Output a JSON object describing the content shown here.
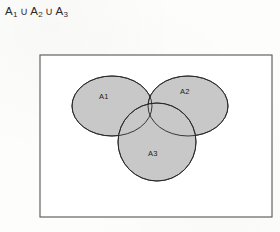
{
  "figure": {
    "title": {
      "set_a": "A",
      "sub_1": "1",
      "union_op_1": "∪",
      "set_b": "A",
      "sub_2": "2",
      "union_op_2": "∪",
      "set_c": "A",
      "sub_3": "3"
    },
    "universal_box": {
      "x": 40,
      "y": 55,
      "width": 232,
      "height": 162,
      "border_color": "#555555",
      "fill_color": "#ffffff"
    },
    "colors": {
      "set_fill": "#c8c8c8",
      "set_outline": "#262626",
      "background": "#fdfdfb",
      "text": "#202020"
    },
    "sets": [
      {
        "id": "a1",
        "label": "A1",
        "shape": "ellipse",
        "cx": 112,
        "cy": 106,
        "rx": 40,
        "ry": 30,
        "label_x": 99,
        "label_y": 99
      },
      {
        "id": "a2",
        "label": "A2",
        "shape": "ellipse",
        "cx": 188,
        "cy": 106,
        "rx": 40,
        "ry": 30,
        "label_x": 180,
        "label_y": 94
      },
      {
        "id": "a3",
        "label": "A3",
        "shape": "circle",
        "cx": 157,
        "cy": 142,
        "rx": 39,
        "ry": 39,
        "label_x": 148,
        "label_y": 156
      }
    ]
  }
}
